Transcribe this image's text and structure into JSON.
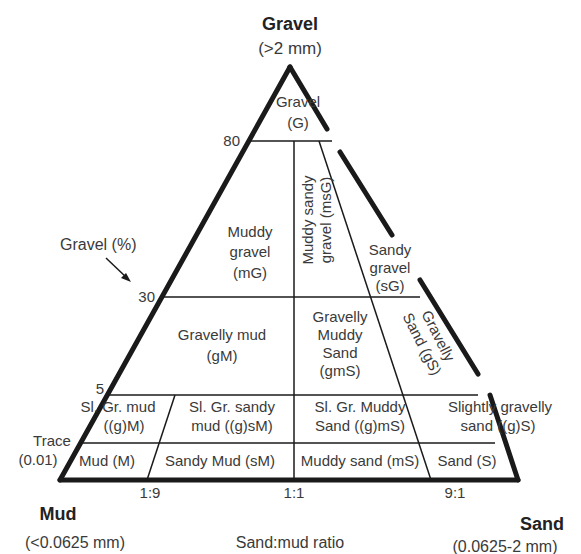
{
  "vertices": {
    "gravel": {
      "name": "Gravel",
      "size": "(>2 mm)"
    },
    "mud": {
      "name": "Mud",
      "size": "(<0.0625 mm)"
    },
    "sand": {
      "name": "Sand",
      "size": "(0.0625-2 mm)"
    }
  },
  "axis": {
    "gravel_label": "Gravel (%)",
    "gravel_ticks": [
      "80",
      "30",
      "5"
    ],
    "trace_label": "Trace",
    "trace_value": "(0.01)",
    "ratio_label": "Sand:mud ratio",
    "ratio_ticks": [
      "1:9",
      "1:1",
      "9:1"
    ]
  },
  "regions": {
    "G": [
      "Gravel",
      "(G)"
    ],
    "mG": [
      "Muddy",
      "gravel",
      "(mG)"
    ],
    "msG": [
      "Muddy sandy",
      "gravel (msG)"
    ],
    "sG": [
      "Sandy",
      "gravel",
      "(sG)"
    ],
    "gM": [
      "Gravelly mud",
      "(gM)"
    ],
    "gmS": [
      "Gravelly",
      "Muddy",
      "Sand",
      "(gmS)"
    ],
    "gS": [
      "Gravelly",
      "Sand (gS)"
    ],
    "gM_sl": [
      "Sl. Gr. mud",
      "((g)M)"
    ],
    "gsM_sl": [
      "Sl. Gr. sandy",
      "mud ((g)sM)"
    ],
    "gmS_sl": [
      "Sl. Gr. Muddy",
      "Sand ((g)mS)"
    ],
    "gS_sl": [
      "Slightly gravelly",
      "sand ((g)S)"
    ],
    "M": "Mud (M)",
    "sM": "Sandy Mud (sM)",
    "mS": "Muddy sand (mS)",
    "S": "Sand (S)"
  }
}
